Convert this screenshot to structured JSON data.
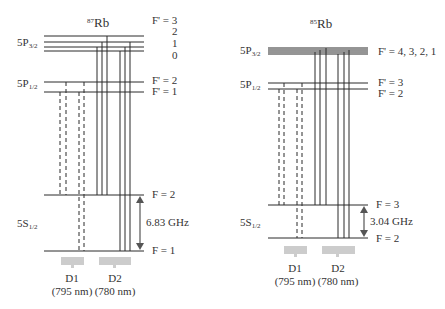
{
  "diagrams": [
    {
      "isotope_mass": "87",
      "isotope_symbol": "Rb",
      "states": {
        "p32": {
          "main": "5P",
          "sub": "3/2"
        },
        "p12": {
          "main": "5P",
          "sub": "1/2"
        },
        "s12": {
          "main": "5S",
          "sub": "1/2"
        }
      },
      "p32_labels": [
        "F' = 3",
        "2",
        "1",
        "0"
      ],
      "p12_labels": [
        "F' = 2",
        "F' = 1"
      ],
      "s_labels": [
        "F = 2",
        "F = 1"
      ],
      "splitting": "6.83 GHz",
      "lines": [
        "D1",
        "D2"
      ],
      "wavelengths": [
        "(795 nm)",
        "(780 nm)"
      ]
    },
    {
      "isotope_mass": "85",
      "isotope_symbol": "Rb",
      "states": {
        "p32": {
          "main": "5P",
          "sub": "3/2"
        },
        "p12": {
          "main": "5P",
          "sub": "1/2"
        },
        "s12": {
          "main": "5S",
          "sub": "1/2"
        }
      },
      "p32_labels": [
        "F' = 4, 3, 2, 1"
      ],
      "p12_labels": [
        "F' = 3",
        "F' = 2"
      ],
      "s_labels": [
        "F = 3",
        "F = 2"
      ],
      "splitting": "3.04 GHz",
      "lines": [
        "D1",
        "D2"
      ],
      "wavelengths": [
        "(795 nm)",
        "(780 nm)"
      ]
    }
  ],
  "colors": {
    "line": "#2a2a2a",
    "arrow": "#555555",
    "band": "#cccccc"
  }
}
